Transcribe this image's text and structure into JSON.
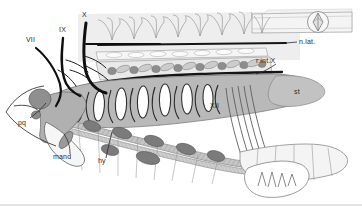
{
  "figure": {
    "name": "cranial-nerve-branchial-anatomy-diagram",
    "background_color": "#ffffff",
    "ink_color": "#2b2b2b",
    "nerve_color": "#111111",
    "tones": {
      "pale": "#eeeeee",
      "light_gray": "#d8d8d8",
      "mid_gray": "#b3b3b3",
      "dark_gray": "#8a8a8a",
      "darker_gray": "#6e6e6e",
      "white": "#ffffff"
    }
  },
  "labels": [
    {
      "id": "vii",
      "text": "VII",
      "x": 26,
      "y": 42
    },
    {
      "id": "ix",
      "text": "IX",
      "x": 59,
      "y": 32
    },
    {
      "id": "x",
      "text": "X",
      "x": 82,
      "y": 17
    },
    {
      "id": "n-lat",
      "text": "n.lat.",
      "x": 288,
      "y": 41
    },
    {
      "id": "r-int-x",
      "text": "r.int.X",
      "x": 259,
      "y": 61
    },
    {
      "id": "st",
      "text": "st",
      "x": 294,
      "y": 91
    },
    {
      "id": "xii",
      "text": "XII",
      "x": 212,
      "y": 105
    },
    {
      "id": "pq",
      "text": "pq",
      "x": 18,
      "y": 122
    },
    {
      "id": "mand",
      "text": "mand",
      "x": 53,
      "y": 156
    },
    {
      "id": "hy",
      "text": "hy",
      "x": 98,
      "y": 160
    }
  ],
  "footer_rule": {
    "present": true,
    "y": 205,
    "color": "#c9c9c9"
  }
}
